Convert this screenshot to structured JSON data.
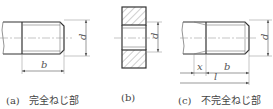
{
  "figures": [
    {
      "id": "a",
      "label": "(a)",
      "caption": "完全ねじ部",
      "dims": {
        "diameter": "d",
        "thread_length": "b"
      }
    },
    {
      "id": "b",
      "label": "(b)",
      "caption": "",
      "dims": {
        "diameter": "d"
      }
    },
    {
      "id": "c",
      "label": "(c)",
      "caption": "不完全ねじ部",
      "dims": {
        "diameter": "d",
        "incomplete": "x",
        "thread_length": "b",
        "length": "l"
      }
    }
  ],
  "colors": {
    "line": "#333333",
    "thin": "#777777",
    "hatch": "#888888"
  }
}
